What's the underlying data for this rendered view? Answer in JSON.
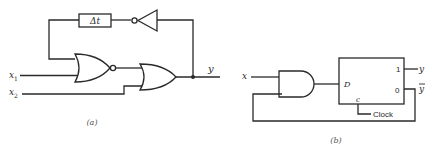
{
  "figure_a": {
    "caption": "(a)",
    "delay_label": "Δt",
    "input_1": {
      "name": "x",
      "subscript": "1"
    },
    "input_2": {
      "name": "x",
      "subscript": "2"
    },
    "output_label": "y",
    "components": [
      "NOR gate",
      "OR gate",
      "inverter",
      "delay element"
    ]
  },
  "figure_b": {
    "caption": "(b)",
    "input_label": "x",
    "flip_flop": {
      "d_input": "D",
      "clock_input": "c",
      "output_1": "1",
      "output_0": "0"
    },
    "clock_label": "Clock",
    "output_y": "y",
    "output_y_bar": "y",
    "components": [
      "AND gate",
      "D flip-flop"
    ]
  },
  "colors": {
    "line": "#2a2a2a",
    "background": "#ffffff"
  }
}
